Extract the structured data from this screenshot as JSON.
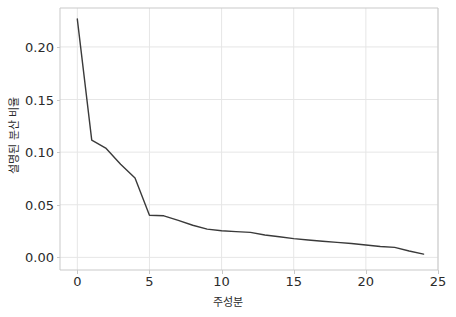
{
  "chart_data": {
    "type": "line",
    "title": "",
    "subtitle": "",
    "xlabel": "주성분",
    "ylabel": "설명된 분산 비율",
    "xlim": [
      -1.2,
      25.0
    ],
    "ylim": [
      -0.012,
      0.237
    ],
    "xticks": [
      0,
      5,
      10,
      15,
      20,
      25
    ],
    "xtick_labels": [
      "0",
      "5",
      "10",
      "15",
      "20",
      "25"
    ],
    "yticks": [
      0.0,
      0.05,
      0.1,
      0.15,
      0.2
    ],
    "ytick_labels": [
      "0.00",
      "0.05",
      "0.10",
      "0.15",
      "0.20"
    ],
    "grid": true,
    "legend": null,
    "series": [
      {
        "name": "설명된 분산 비율",
        "color": "#3a3a3a",
        "x": [
          0,
          1,
          2,
          3,
          4,
          5,
          6,
          7,
          8,
          9,
          10,
          11,
          12,
          13,
          14,
          15,
          16,
          17,
          18,
          19,
          20,
          21,
          22,
          23,
          24
        ],
        "values": [
          0.2265,
          0.1115,
          0.1035,
          0.0885,
          0.0755,
          0.04,
          0.0395,
          0.0352,
          0.0305,
          0.0268,
          0.0253,
          0.0245,
          0.0238,
          0.0213,
          0.0196,
          0.0178,
          0.0165,
          0.0153,
          0.0143,
          0.0132,
          0.0118,
          0.0104,
          0.0095,
          0.0061,
          0.0031
        ]
      }
    ]
  },
  "axes": {
    "x_tick_labels": [
      "0",
      "5",
      "10",
      "15",
      "20",
      "25"
    ],
    "y_tick_labels": [
      "0.00",
      "0.05",
      "0.10",
      "0.15",
      "0.20"
    ],
    "x_axis_label": "주성분",
    "y_axis_label": "설명된 분산 비율"
  },
  "style": {
    "background": "#ffffff",
    "grid_color": "#e6e6e6",
    "spine_color": "#c9c9c9",
    "line_color": "#3a3a3a",
    "tick_text_color": "#2b2b2b"
  }
}
